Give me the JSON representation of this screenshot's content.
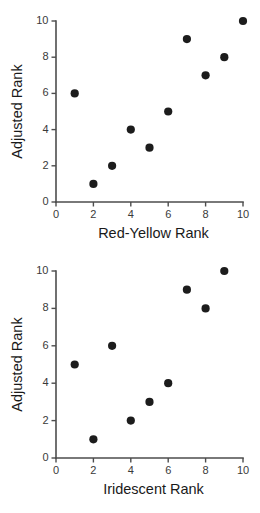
{
  "figure": {
    "panels": [
      {
        "id": "top",
        "ylabel": "Adjusted Rank",
        "xlabel": "Red-Yellow Rank"
      },
      {
        "id": "bottom",
        "ylabel": "Adjusted Rank",
        "xlabel": "Iridescent Rank"
      }
    ],
    "marker_color": "#1c1c1c",
    "axis_color": "#4d4d4d"
  },
  "chart_data": [
    {
      "type": "scatter",
      "title": "",
      "xlabel": "Red-Yellow Rank",
      "ylabel": "Adjusted Rank",
      "xlim": [
        0,
        10
      ],
      "ylim": [
        0,
        10
      ],
      "xticks": [
        0,
        2,
        4,
        6,
        8,
        10
      ],
      "yticks": [
        0,
        2,
        4,
        6,
        8,
        10
      ],
      "grid": false,
      "legend": false,
      "x": [
        1,
        2,
        3,
        4,
        5,
        6,
        7,
        8,
        9,
        10
      ],
      "y": [
        6,
        1,
        2,
        4,
        3,
        5,
        9,
        7,
        8,
        10
      ],
      "points": [
        {
          "x": 1,
          "y": 6
        },
        {
          "x": 2,
          "y": 1
        },
        {
          "x": 3,
          "y": 2
        },
        {
          "x": 4,
          "y": 4
        },
        {
          "x": 5,
          "y": 3
        },
        {
          "x": 6,
          "y": 5
        },
        {
          "x": 7,
          "y": 9
        },
        {
          "x": 8,
          "y": 7
        },
        {
          "x": 9,
          "y": 8
        },
        {
          "x": 10,
          "y": 10
        }
      ]
    },
    {
      "type": "scatter",
      "title": "",
      "xlabel": "Iridescent Rank",
      "ylabel": "Adjusted Rank",
      "xlim": [
        0,
        10
      ],
      "ylim": [
        0,
        10
      ],
      "xticks": [
        0,
        2,
        4,
        6,
        8,
        10
      ],
      "yticks": [
        0,
        2,
        4,
        6,
        8,
        10
      ],
      "grid": false,
      "legend": false,
      "x": [
        1,
        2,
        3,
        4,
        5,
        6,
        7,
        8,
        9
      ],
      "y": [
        5,
        1,
        6,
        2,
        3,
        4,
        9,
        8,
        10
      ],
      "points": [
        {
          "x": 1,
          "y": 5
        },
        {
          "x": 2,
          "y": 1
        },
        {
          "x": 3,
          "y": 6
        },
        {
          "x": 4,
          "y": 2
        },
        {
          "x": 5,
          "y": 3
        },
        {
          "x": 6,
          "y": 4
        },
        {
          "x": 7,
          "y": 9
        },
        {
          "x": 8,
          "y": 8
        },
        {
          "x": 9,
          "y": 10
        }
      ]
    }
  ]
}
